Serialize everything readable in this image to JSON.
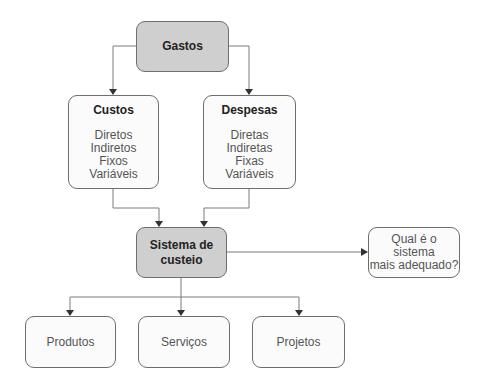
{
  "diagram": {
    "root": {
      "label": "Gastos"
    },
    "categories": [
      {
        "title": "Custos",
        "items": [
          "Diretos",
          "Indiretos",
          "Fixos",
          "Variáveis"
        ]
      },
      {
        "title": "Despesas",
        "items": [
          "Diretas",
          "Indiretas",
          "Fixas",
          "Variáveis"
        ]
      }
    ],
    "system": {
      "line1": "Sistema de",
      "line2": "custeio"
    },
    "question": {
      "line1": "Qual é o sistema",
      "line2": "mais adequado?"
    },
    "outputs": [
      {
        "label": "Produtos"
      },
      {
        "label": "Serviços"
      },
      {
        "label": "Projetos"
      }
    ],
    "colors": {
      "highlight_fill": "#cfcfcf",
      "box_fill": "#fbfbfb",
      "stroke": "#6e6e6e",
      "text": "#555555"
    }
  }
}
